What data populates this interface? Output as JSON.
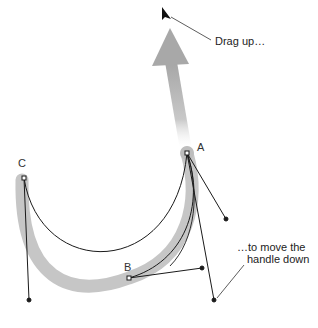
{
  "diagram": {
    "type": "bezier-path-edit-illustration",
    "annotations": {
      "drag_up": "Drag up…",
      "move_handle_line1": "…to move the",
      "move_handle_line2": "handle down"
    },
    "points": {
      "a": {
        "label": "A",
        "x": 187,
        "y": 153
      },
      "b": {
        "label": "B",
        "x": 129,
        "y": 278
      },
      "c": {
        "label": "C",
        "x": 24,
        "y": 178
      }
    },
    "colors": {
      "stroke": "#1a1a1a",
      "highlight_path": "#c4c4c4",
      "arrow": "#aaaaaa",
      "background": "#ffffff"
    }
  }
}
